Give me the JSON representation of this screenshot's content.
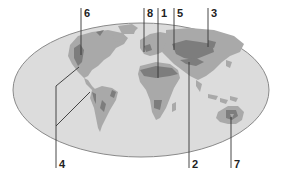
{
  "figure": {
    "type": "world-map-diagram",
    "colors": {
      "ocean": "#dcdcdc",
      "ocean_border": "#8a8a8a",
      "land_light": "#a9a9a9",
      "land_dark": "#7d7d7d",
      "lines": "#333333",
      "text": "#222222"
    }
  },
  "labels": [
    {
      "id": "6",
      "text": "6",
      "region": "western North America"
    },
    {
      "id": "8",
      "text": "8",
      "region": "western Europe"
    },
    {
      "id": "1",
      "text": "1",
      "region": "northern Africa"
    },
    {
      "id": "5",
      "text": "5",
      "region": "central Asia / Caspian"
    },
    {
      "id": "3",
      "text": "3",
      "region": "eastern Asia / Mongolia"
    },
    {
      "id": "2",
      "text": "2",
      "region": "Himalaya / Tibetan plateau"
    },
    {
      "id": "7",
      "text": "7",
      "region": "central Australia"
    },
    {
      "id": "4",
      "text": "4",
      "region": "Central America and western South America"
    }
  ]
}
